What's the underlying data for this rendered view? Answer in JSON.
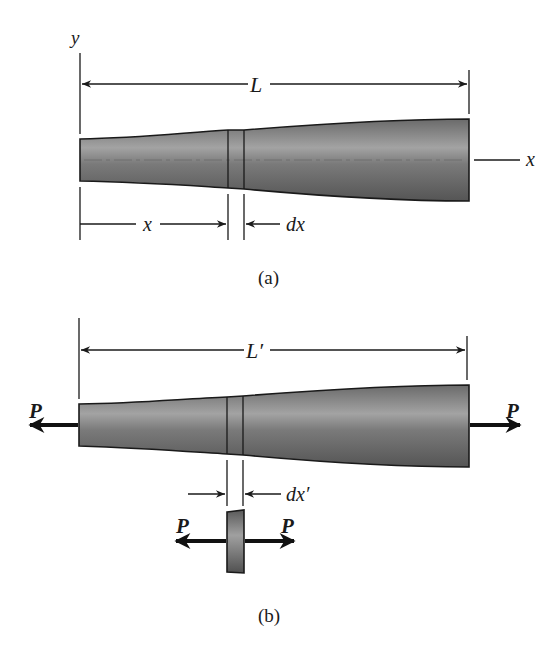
{
  "figure_a": {
    "caption": "(a)",
    "axis_y_label": "y",
    "axis_x_label": "x",
    "length_label": "L",
    "position_label": "x",
    "element_label": "dx"
  },
  "figure_b": {
    "caption": "(b)",
    "length_label": "L′",
    "element_label": "dx′",
    "left_force_label": "P",
    "right_force_label": "P",
    "element_left_force_label": "P",
    "element_right_force_label": "P"
  },
  "colors": {
    "bar_dark": "#4a4a4a",
    "bar_light": "#9a9a9a",
    "line": "#1a1a1a",
    "background": "#ffffff"
  }
}
